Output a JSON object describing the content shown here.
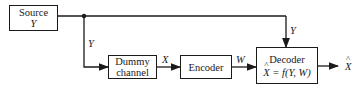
{
  "diagram": {
    "type": "block-diagram",
    "blocks": {
      "source": {
        "title": "Source",
        "var": "Y"
      },
      "dummy_channel": {
        "line1": "Dummy",
        "line2": "channel"
      },
      "encoder": {
        "title": "Encoder"
      },
      "decoder": {
        "title": "Decoder",
        "eq_lhs": "X",
        "eq_rhs": "= f(Y, W)"
      }
    },
    "edges": {
      "y_to_dummy": "Y",
      "dummy_to_encoder": "X",
      "encoder_to_decoder": "W",
      "source_to_decoder": "Y",
      "output": "X"
    }
  }
}
